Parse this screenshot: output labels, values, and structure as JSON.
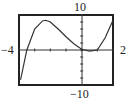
{
  "window": {
    "xmin_label": "−4",
    "xmax_label": "2",
    "ymax_label": "10",
    "ymin_label": "−10"
  },
  "chart_data": {
    "type": "line",
    "title": "",
    "xlabel": "",
    "ylabel": "",
    "xlim": [
      -4,
      2
    ],
    "ylim": [
      -10,
      10
    ],
    "grid": false,
    "legend": null,
    "tick_marks": {
      "x_step": 1,
      "y_step": 2
    },
    "series": [
      {
        "name": "f(x)",
        "x": [
          -3.9,
          -3.5,
          -3.0,
          -2.5,
          -2.3,
          -2.0,
          -1.5,
          -1.0,
          -0.5,
          0.0,
          0.5,
          1.0,
          1.5,
          2.0
        ],
        "y": [
          -8.5,
          0.0,
          6.0,
          8.3,
          8.5,
          8.0,
          6.0,
          3.8,
          1.8,
          0.2,
          -0.3,
          0.0,
          3.5,
          8.5
        ]
      }
    ]
  }
}
